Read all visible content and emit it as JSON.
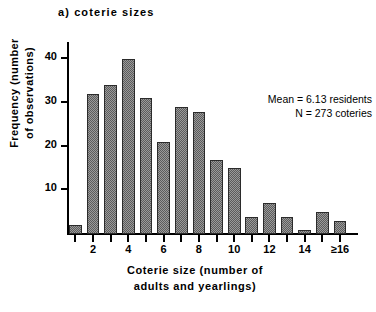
{
  "panel": {
    "title": "a)  coterie  sizes"
  },
  "annotation": {
    "line1": "Mean  =  6.13 residents",
    "line2": "N  =  273 coteries"
  },
  "axes": {
    "y_title_line1": "Frequency  (number",
    "y_title_line2": "of  observations)",
    "x_title_line1": "Coterie  size  (number  of",
    "x_title_line2": "adults  and  yearlings)",
    "y_tick_labels": [
      "40",
      "30",
      "20",
      "10"
    ],
    "x_tick_labels": [
      "2",
      "4",
      "6",
      "8",
      "10",
      "12",
      "14",
      "≥16"
    ]
  },
  "colors": {
    "axis": "#000000",
    "bar_fill_light": "#9a9a9a",
    "bar_fill_dark": "#5c5c5c",
    "bar_edge": "#2b2b2b",
    "background": "#ffffff"
  },
  "chart_data": {
    "type": "bar",
    "title": "a)  coterie  sizes",
    "xlabel": "Coterie size (number of adults and yearlings)",
    "ylabel": "Frequency (number of observations)",
    "categories": [
      "1",
      "2",
      "3",
      "4",
      "5",
      "6",
      "7",
      "8",
      "9",
      "10",
      "11",
      "12",
      "13",
      "14",
      "15",
      "≥16"
    ],
    "values": [
      2,
      32,
      34,
      40,
      31,
      21,
      29,
      28,
      17,
      15,
      4,
      7,
      4,
      1,
      5,
      3
    ],
    "ylim": [
      0,
      43
    ],
    "yticks": [
      10,
      20,
      30,
      40
    ],
    "xticks_labeled": [
      2,
      4,
      6,
      8,
      10,
      12,
      14,
      16
    ],
    "grid": false,
    "legend": false,
    "annotations": [
      "Mean = 6.13 residents",
      "N = 273 coteries"
    ],
    "mean": 6.13,
    "n": 273
  }
}
